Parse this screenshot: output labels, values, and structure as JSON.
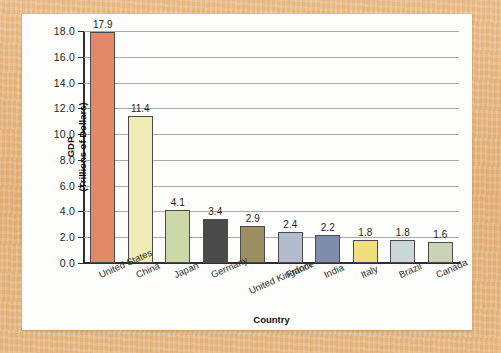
{
  "chart_data": {
    "type": "bar",
    "title": "",
    "xlabel": "Country",
    "ylabel_line1": "GDP",
    "ylabel_line2": "(Trillions of Dollars)",
    "ylim": [
      0,
      18
    ],
    "ytick_step": 2,
    "grid": true,
    "legend": "none",
    "ytick_labels": [
      "0.0",
      "2.0",
      "4.0",
      "6.0",
      "8.0",
      "10.0",
      "12.0",
      "14.0",
      "16.0",
      "18.0"
    ],
    "categories": [
      "United States",
      "China",
      "Japan",
      "Germany",
      "United Kingdom",
      "France",
      "India",
      "Italy",
      "Brazil",
      "Canada"
    ],
    "values": [
      17.9,
      11.4,
      4.1,
      3.4,
      2.9,
      2.4,
      2.2,
      1.8,
      1.8,
      1.6
    ],
    "value_labels": [
      "17.9",
      "11.4",
      "4.1",
      "3.4",
      "2.9",
      "2.4",
      "2.2",
      "1.8",
      "1.8",
      "1.6"
    ],
    "bar_colors": [
      "#e08a6a",
      "#f0ecb8",
      "#cdd8a8",
      "#4a4a4a",
      "#9b8f63",
      "#b3bccd",
      "#7f8cab",
      "#f2de7e",
      "#cbd7d6",
      "#ccd2b8"
    ]
  },
  "colors": {
    "frame": "#e7b680",
    "card": "#fdfdfb",
    "axis": "#2e2e2e",
    "gridline": "#a9a9a9",
    "text": "#1d1d1d"
  }
}
